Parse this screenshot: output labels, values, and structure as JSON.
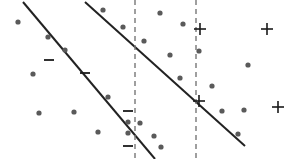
{
  "figure": {
    "name": "svm-margin-scatter-diagram",
    "width": 299,
    "height": 159,
    "background_color": "#ffffff"
  },
  "chart_data": {
    "type": "scatter",
    "title": "",
    "subtitle": "",
    "xlabel": "",
    "ylabel": "",
    "xlim": [
      0,
      299
    ],
    "ylim": [
      0,
      159
    ],
    "grid": false,
    "legend": null,
    "axes_visible": false,
    "tick_labels": [],
    "annotations": [],
    "colors": {
      "dot": "#5a5a5a",
      "line": "#222222",
      "dashed_line": "#777777",
      "marker": "#1a1a1a",
      "background": "#ffffff"
    },
    "series": [
      {
        "name": "unlabeled-points",
        "marker": "dot",
        "color": "#5a5a5a",
        "radius": 2.6,
        "points": [
          {
            "x": 18,
            "y": 22
          },
          {
            "x": 48,
            "y": 37
          },
          {
            "x": 65,
            "y": 50
          },
          {
            "x": 33,
            "y": 74
          },
          {
            "x": 39,
            "y": 113
          },
          {
            "x": 74,
            "y": 112
          },
          {
            "x": 98,
            "y": 132
          },
          {
            "x": 103,
            "y": 10
          },
          {
            "x": 123,
            "y": 27
          },
          {
            "x": 108,
            "y": 97
          },
          {
            "x": 144,
            "y": 41
          },
          {
            "x": 160,
            "y": 13
          },
          {
            "x": 170,
            "y": 55
          },
          {
            "x": 183,
            "y": 24
          },
          {
            "x": 199,
            "y": 51
          },
          {
            "x": 180,
            "y": 78
          },
          {
            "x": 212,
            "y": 86
          },
          {
            "x": 128,
            "y": 122
          },
          {
            "x": 140,
            "y": 123
          },
          {
            "x": 128,
            "y": 133
          },
          {
            "x": 154,
            "y": 136
          },
          {
            "x": 161,
            "y": 147
          },
          {
            "x": 222,
            "y": 111
          },
          {
            "x": 244,
            "y": 110
          },
          {
            "x": 238,
            "y": 134
          },
          {
            "x": 248,
            "y": 65
          }
        ]
      },
      {
        "name": "positive-class-points",
        "marker": "plus",
        "color": "#1a1a1a",
        "size": 12,
        "label": "+",
        "points": [
          {
            "x": 200,
            "y": 29
          },
          {
            "x": 267,
            "y": 29
          },
          {
            "x": 199,
            "y": 101
          },
          {
            "x": 278,
            "y": 107
          }
        ]
      },
      {
        "name": "negative-class-points",
        "marker": "minus",
        "color": "#1a1a1a",
        "size": 12,
        "label": "-",
        "points": [
          {
            "x": 49,
            "y": 60
          },
          {
            "x": 85,
            "y": 73
          },
          {
            "x": 128,
            "y": 111
          },
          {
            "x": 128,
            "y": 146
          }
        ]
      }
    ],
    "lines": [
      {
        "name": "decision-boundary-upper",
        "style": "solid",
        "color": "#222222",
        "width": 2,
        "x1": 23,
        "y1": 2,
        "x2": 155,
        "y2": 159
      },
      {
        "name": "decision-boundary-lower",
        "style": "solid",
        "color": "#222222",
        "width": 2,
        "x1": 85,
        "y1": 2,
        "x2": 245,
        "y2": 146
      },
      {
        "name": "margin-divider-left",
        "style": "dashed",
        "color": "#777777",
        "width": 1.4,
        "dash": "5 4",
        "x1": 135,
        "y1": 0,
        "x2": 135,
        "y2": 159
      },
      {
        "name": "margin-divider-right",
        "style": "dashed",
        "color": "#777777",
        "width": 1.4,
        "dash": "5 4",
        "x1": 196,
        "y1": 0,
        "x2": 196,
        "y2": 159
      }
    ]
  }
}
